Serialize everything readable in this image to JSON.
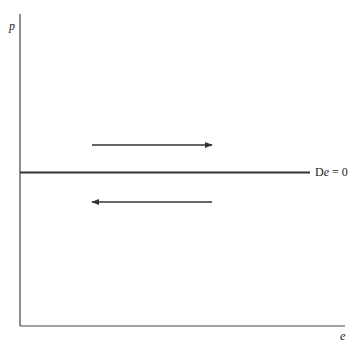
{
  "diagram": {
    "y_axis_label": "p",
    "x_axis_label": "e",
    "line_label_prefix": "D",
    "line_label_var": "e",
    "line_label_suffix": " = 0",
    "arrows": [
      {
        "direction": "right",
        "position": "above line"
      },
      {
        "direction": "left",
        "position": "below line"
      }
    ],
    "colors": {
      "line": "#333333",
      "background": "#ffffff"
    }
  }
}
